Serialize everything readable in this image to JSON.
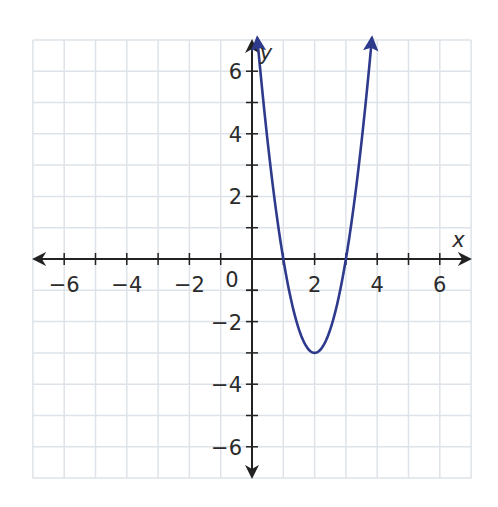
{
  "chart_data": {
    "type": "line",
    "title": "",
    "xlabel": "x",
    "ylabel": "y",
    "xlim": [
      -7,
      7
    ],
    "ylim": [
      -7,
      7
    ],
    "grid": true,
    "legend": null,
    "x_ticks": [
      -6,
      -4,
      -2,
      2,
      4,
      6
    ],
    "y_ticks": [
      -6,
      -4,
      -2,
      2,
      4,
      6
    ],
    "x_tick_labels": [
      "−6",
      "−4",
      "−2",
      "2",
      "4",
      "6"
    ],
    "y_tick_labels": [
      "−6",
      "−4",
      "−2",
      "2",
      "4",
      "6"
    ],
    "origin_label": "0",
    "series": [
      {
        "name": "parabola",
        "equation": "y = 3(x − 2)² − 3",
        "color": "#2e3a8c",
        "vertex": [
          2,
          -3
        ],
        "x_intercepts": [
          1,
          3
        ],
        "x": [
          0.17,
          0.5,
          1,
          1.5,
          2,
          2.5,
          3,
          3.5,
          3.83
        ],
        "values": [
          7,
          3.75,
          0,
          -2.25,
          -3,
          -2.25,
          0,
          3.75,
          7
        ],
        "arrows_at_ends": true
      }
    ]
  },
  "colors": {
    "grid": "#dde3e8",
    "axis": "#222222",
    "curve": "#2e3a8c"
  }
}
